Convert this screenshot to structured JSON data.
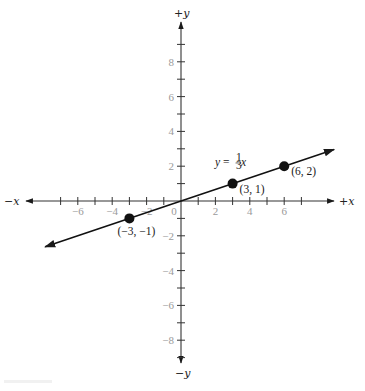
{
  "chart_data": {
    "type": "line",
    "title": "",
    "equation": "y = ⅓x",
    "equation_parts": {
      "lhs": "y",
      "eq": " = ",
      "frac_num": "1",
      "frac_den": "3",
      "var": "x"
    },
    "xlabel_pos": "+x",
    "xlabel_neg": "−x",
    "ylabel_pos": "+y",
    "ylabel_neg": "−y",
    "xlim": [
      -9,
      9
    ],
    "ylim": [
      -9,
      9
    ],
    "x_tick_labels": [
      "−6",
      "−4",
      "−2",
      "0",
      "2",
      "4",
      "6"
    ],
    "x_tick_values": [
      -6,
      -4,
      -2,
      0,
      2,
      4,
      6
    ],
    "y_tick_labels": [
      "8",
      "6",
      "4",
      "2",
      "−2",
      "−4",
      "−6",
      "−8"
    ],
    "y_tick_values": [
      8,
      6,
      4,
      2,
      -2,
      -4,
      -6,
      -8
    ],
    "grid": false,
    "series": [
      {
        "name": "y = (1/3)x",
        "slope": 0.3333,
        "intercept": 0,
        "line_range_x": [
          -7.9,
          8.9
        ]
      }
    ],
    "points": [
      {
        "x": -3,
        "y": -1,
        "label": "(−3, −1)"
      },
      {
        "x": 3,
        "y": 1,
        "label": "(3, 1)"
      },
      {
        "x": 6,
        "y": 2,
        "label": "(6, 2)"
      }
    ]
  }
}
